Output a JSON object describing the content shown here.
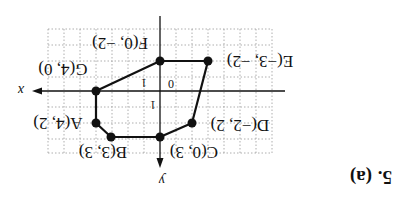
{
  "problem": {
    "number": "5.",
    "part": "(a)"
  },
  "orientation": "rotated 180 degrees",
  "axes": {
    "x_label": "x",
    "y_label": "y",
    "origin_label": "0",
    "x_tick_label": "1",
    "y_tick_label": "1"
  },
  "points": [
    {
      "name": "A",
      "label": "A(4, 2)",
      "x": 4,
      "y": 2
    },
    {
      "name": "B",
      "label": "B(3, 3)",
      "x": 3,
      "y": 3
    },
    {
      "name": "C",
      "label": "C(0, 3)",
      "x": 0,
      "y": 3
    },
    {
      "name": "D",
      "label": "D(−2, 2)",
      "x": -2,
      "y": 2
    },
    {
      "name": "E",
      "label": "E(−3, −2)",
      "x": -3,
      "y": -2
    },
    {
      "name": "F",
      "label": "F(0, −2)",
      "x": 0,
      "y": -2
    },
    {
      "name": "G",
      "label": "G(4, 0)",
      "x": 4,
      "y": 0
    }
  ],
  "polygon_order": [
    "A",
    "B",
    "C",
    "D",
    "E",
    "F",
    "G"
  ],
  "colors": {
    "line": "#111111",
    "grid": "#9a9a9a",
    "background": "#ffffff"
  }
}
